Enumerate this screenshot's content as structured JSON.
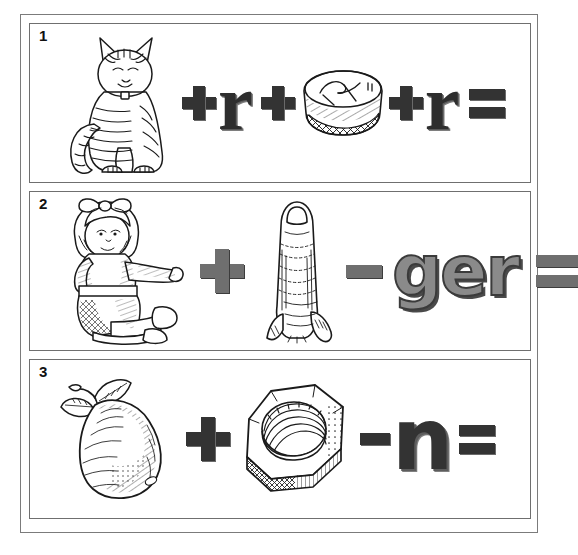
{
  "worksheet": {
    "title": "Rebus picture word puzzles",
    "background_color": "#ffffff",
    "frame_color": "#7b7b7b"
  },
  "puzzles": [
    {
      "number": "1",
      "elements": [
        {
          "kind": "picture",
          "name": "cat-illustration",
          "label": "cat"
        },
        {
          "kind": "operator",
          "name": "plus-operator",
          "label": "+"
        },
        {
          "kind": "letter",
          "name": "letter-r",
          "label": "r"
        },
        {
          "kind": "operator",
          "name": "plus-operator",
          "label": "+"
        },
        {
          "kind": "picture",
          "name": "basket-illustration",
          "label": "basket"
        },
        {
          "kind": "operator",
          "name": "plus-operator",
          "label": "+"
        },
        {
          "kind": "letter",
          "name": "letter-r",
          "label": "r"
        },
        {
          "kind": "operator",
          "name": "equals-operator",
          "label": "="
        }
      ],
      "letter_style": "serif-dark",
      "letter_1": "r",
      "letter_2": "r"
    },
    {
      "number": "2",
      "elements": [
        {
          "kind": "picture",
          "name": "doll-illustration",
          "label": "doll"
        },
        {
          "kind": "operator",
          "name": "plus-operator",
          "label": "+"
        },
        {
          "kind": "picture",
          "name": "finger-illustration",
          "label": "finger"
        },
        {
          "kind": "operator",
          "name": "minus-operator",
          "label": "-"
        },
        {
          "kind": "letter",
          "name": "letters-ger",
          "label": "ger"
        },
        {
          "kind": "operator",
          "name": "equals-operator",
          "label": "="
        }
      ],
      "letter_style": "sans-gray",
      "letters": "ger"
    },
    {
      "number": "3",
      "elements": [
        {
          "kind": "picture",
          "name": "pear-illustration",
          "label": "pear"
        },
        {
          "kind": "operator",
          "name": "plus-operator",
          "label": "+"
        },
        {
          "kind": "picture",
          "name": "hex-nut-illustration",
          "label": "nut"
        },
        {
          "kind": "operator",
          "name": "minus-operator",
          "label": "-"
        },
        {
          "kind": "letter",
          "name": "letter-n",
          "label": "n"
        },
        {
          "kind": "operator",
          "name": "equals-operator",
          "label": "="
        }
      ],
      "letter_style": "sans-dark",
      "letters": "n"
    }
  ],
  "colors": {
    "ink": "#1a1a1a",
    "dark_glyph": "#333333",
    "gray_glyph": "#8a8a8a",
    "panel_border": "#6f6f6f",
    "outer_border": "#7b7b7b"
  }
}
